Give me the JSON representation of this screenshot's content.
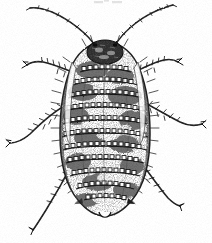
{
  "figure": {
    "kind": "scanned-line-engraving",
    "subject_label": "aphid-dorsal-view",
    "view": "dorsal",
    "technique": "stipple-and-hatch engraving",
    "background_color": "#ffffff",
    "ink_color": "#1a1a1a",
    "mid_ink_color": "#4a4a4a",
    "light_ink_color": "#8a8a8a",
    "width_px": 212,
    "height_px": 243,
    "caption": "",
    "top_artifact": "faint cropped mark at page top edge"
  },
  "anatomy": {
    "head": {
      "label": "head",
      "cx": 105,
      "cy": 52,
      "rx": 17,
      "ry": 11,
      "tone": "dark granulated"
    },
    "body": {
      "label": "abdomen-and-thorax",
      "cx": 105,
      "cy": 132,
      "rx": 45,
      "ry": 88,
      "outline_tone": "#222222",
      "fill_tone": "#ffffff"
    },
    "segment_rows": {
      "label": "dorsal-wax-plate-rows",
      "count": 11,
      "y_positions": [
        72,
        85,
        98,
        111,
        124,
        137,
        150,
        163,
        176,
        189,
        200
      ],
      "half_widths": [
        24,
        31,
        36,
        39,
        41,
        42,
        41,
        39,
        35,
        29,
        21
      ],
      "plate_size_px": 4
    },
    "antennae": [
      {
        "label": "left-antenna",
        "side": "left",
        "tip_x": 30,
        "tip_y": 8,
        "base_x": 95,
        "base_y": 46,
        "segments": 6
      },
      {
        "label": "right-antenna",
        "side": "right",
        "tip_x": 172,
        "tip_y": 5,
        "base_x": 114,
        "base_y": 46,
        "segments": 6
      }
    ],
    "legs": [
      {
        "label": "left-foreleg",
        "side": "left",
        "base_x": 72,
        "base_y": 72,
        "tip_x": 28,
        "tip_y": 68
      },
      {
        "label": "left-midleg",
        "side": "left",
        "base_x": 64,
        "base_y": 112,
        "tip_x": 10,
        "tip_y": 143
      },
      {
        "label": "left-hindleg",
        "side": "left",
        "base_x": 70,
        "base_y": 168,
        "tip_x": 32,
        "tip_y": 230
      },
      {
        "label": "right-foreleg",
        "side": "right",
        "base_x": 138,
        "base_y": 72,
        "tip_x": 168,
        "tip_y": 66
      },
      {
        "label": "right-midleg",
        "side": "right",
        "base_x": 146,
        "base_y": 112,
        "tip_x": 202,
        "tip_y": 125
      },
      {
        "label": "right-hindleg",
        "side": "right",
        "base_x": 142,
        "base_y": 168,
        "tip_x": 180,
        "tip_y": 206
      }
    ],
    "cauda": {
      "label": "cauda-tail-tip",
      "x": 105,
      "y": 214
    },
    "bristles": {
      "label": "marginal-setae",
      "description": "fine radiating hairs along body margin and legs"
    }
  }
}
